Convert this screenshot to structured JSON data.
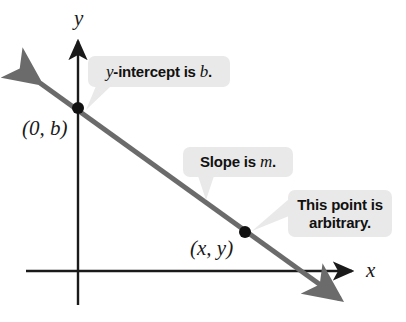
{
  "figure": {
    "type": "coordinate-plane-diagram",
    "background_color": "#ffffff",
    "line_color": "#6b6b6b",
    "axis_color": "#1a1a1a",
    "callout_background": "#e9e9e9",
    "text_color": "#111111"
  },
  "axes": {
    "y_axis_label": "y",
    "x_axis_label": "x",
    "origin": {
      "x": 78,
      "y": 271
    }
  },
  "line": {
    "description": "descending straight line with arrowheads at both ends",
    "slope_sign": "negative",
    "start": {
      "x": 32,
      "y": 77
    },
    "end": {
      "x": 348,
      "y": 305
    }
  },
  "points": [
    {
      "name": "y-intercept-point",
      "label": "(0, b)",
      "x": 78,
      "y": 108
    },
    {
      "name": "arbitrary-point",
      "label": "(x, y)",
      "x": 245,
      "y": 232
    }
  ],
  "callouts": [
    {
      "name": "y-intercept",
      "text_prefix": "",
      "var_lead": "y",
      "text_middle": "-intercept is ",
      "var_trail": "b",
      "text_suffix": ".",
      "full_text": "y-intercept is b."
    },
    {
      "name": "slope",
      "text_prefix": "Slope is ",
      "var_trail": "m",
      "text_suffix": ".",
      "full_text": "Slope is m."
    },
    {
      "name": "arbitrary",
      "line1": "This point is",
      "line2": "arbitrary.",
      "full_text": "This point is arbitrary."
    }
  ]
}
